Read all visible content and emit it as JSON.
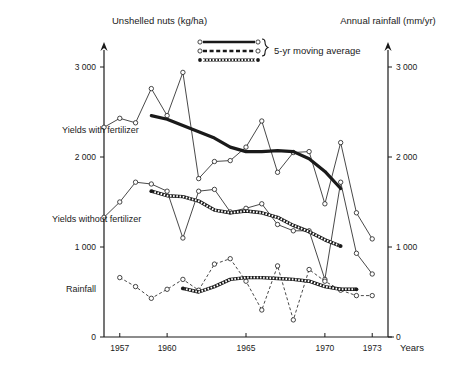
{
  "axes": {
    "left_title": "Unshelled nuts (kg/ha)",
    "right_title": "Annual rainfall (mm/yr)",
    "x_title": "Years",
    "y_ticks": [
      "0",
      "1 000",
      "2 000",
      "3 000"
    ],
    "y_tick_values": [
      0,
      1000,
      2000,
      3000
    ],
    "y_right_ticks": [
      "0",
      "1 000",
      "2 000",
      "3 000"
    ],
    "x_ticks": [
      "1957",
      "1960",
      "1965",
      "1970",
      "1973"
    ],
    "x_tick_values": [
      1957,
      1960,
      1965,
      1970,
      1973
    ]
  },
  "legend": {
    "label": "5-yr moving average",
    "entries": [
      {
        "name": "solid-thick-line",
        "style": "solid"
      },
      {
        "name": "dashed-line",
        "style": "dashed"
      },
      {
        "name": "chain-hatched-line",
        "style": "chain"
      }
    ]
  },
  "series_labels": {
    "with_fertilizer": "Yields with fertilizer",
    "without_fertilizer": "Yields without fertilizer",
    "rainfall": "Rainfall"
  },
  "colors": {
    "ink": "#1a1a1a",
    "paper": "#ffffff"
  },
  "chart_data": {
    "type": "line",
    "title": "",
    "xlabel": "Years",
    "ylabel": "Unshelled nuts (kg/ha)",
    "ylabel_right": "Annual rainfall (mm/yr)",
    "xlim": [
      1956,
      1974
    ],
    "ylim": [
      0,
      3200
    ],
    "ylim_right": [
      0,
      3200
    ],
    "grid": false,
    "legend_position": "top-center",
    "x": [
      1956,
      1957,
      1958,
      1959,
      1960,
      1961,
      1962,
      1963,
      1964,
      1965,
      1966,
      1967,
      1968,
      1969,
      1970,
      1971,
      1972,
      1973
    ],
    "series": [
      {
        "name": "Yields with fertilizer",
        "style": "solid-open-circle",
        "axis": "left",
        "x": [
          1956,
          1957,
          1958,
          1959,
          1960,
          1961,
          1962,
          1963,
          1964,
          1965,
          1966,
          1967,
          1968,
          1969,
          1970,
          1971,
          1972,
          1973
        ],
        "values": [
          2330,
          2430,
          2380,
          2760,
          2460,
          2940,
          1760,
          1950,
          1960,
          2110,
          2400,
          1830,
          2050,
          2060,
          1480,
          2160,
          1380,
          1090
        ]
      },
      {
        "name": "Yields with fertilizer (5-yr moving average)",
        "style": "solid-thick",
        "axis": "left",
        "x": [
          1959,
          1960,
          1961,
          1962,
          1963,
          1964,
          1965,
          1966,
          1967,
          1968,
          1969,
          1970,
          1971
        ],
        "values": [
          2460,
          2420,
          2350,
          2280,
          2210,
          2110,
          2060,
          2060,
          2070,
          2060,
          1980,
          1840,
          1650
        ]
      },
      {
        "name": "Yields without fertilizer",
        "style": "solid-open-circle",
        "axis": "left",
        "x": [
          1956,
          1957,
          1958,
          1959,
          1960,
          1961,
          1962,
          1963,
          1964,
          1965,
          1966,
          1967,
          1968,
          1969,
          1970,
          1971,
          1972,
          1973
        ],
        "values": [
          1330,
          1500,
          1720,
          1700,
          1620,
          1100,
          1620,
          1640,
          1390,
          1430,
          1480,
          1250,
          1180,
          1180,
          640,
          1720,
          930,
          700
        ]
      },
      {
        "name": "Yields without fertilizer (5-yr moving average)",
        "style": "chain-hatched",
        "axis": "left",
        "x": [
          1959,
          1960,
          1961,
          1962,
          1963,
          1964,
          1965,
          1966,
          1967,
          1968,
          1969,
          1970,
          1971
        ],
        "values": [
          1620,
          1570,
          1560,
          1510,
          1410,
          1380,
          1400,
          1380,
          1330,
          1240,
          1170,
          1080,
          1010
        ]
      },
      {
        "name": "Rainfall",
        "style": "dashed-open-circle",
        "axis": "right",
        "x": [
          1957,
          1958,
          1959,
          1960,
          1961,
          1962,
          1963,
          1964,
          1965,
          1966,
          1967,
          1968,
          1969,
          1970,
          1971,
          1972,
          1973
        ],
        "values": [
          660,
          560,
          430,
          530,
          640,
          520,
          810,
          870,
          620,
          300,
          790,
          190,
          750,
          620,
          520,
          460,
          460
        ]
      },
      {
        "name": "Rainfall (5-yr moving average)",
        "style": "chain-hatched",
        "axis": "right",
        "x": [
          1961,
          1962,
          1963,
          1964,
          1965,
          1966,
          1967,
          1968,
          1969,
          1970,
          1971,
          1972
        ],
        "values": [
          540,
          500,
          560,
          640,
          660,
          660,
          650,
          640,
          620,
          560,
          530,
          530
        ]
      }
    ]
  }
}
